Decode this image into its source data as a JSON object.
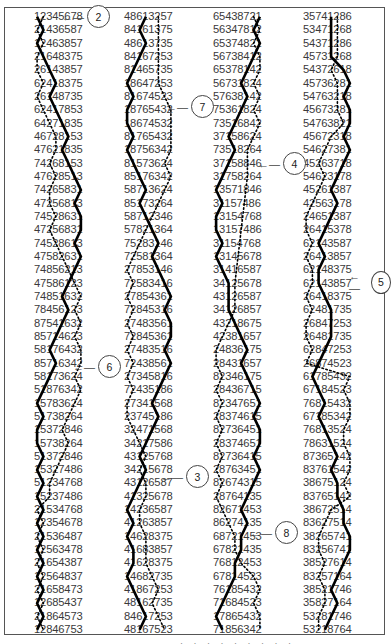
{
  "figure": {
    "columns": [
      {
        "x": 34,
        "rows": [
          "12345678",
          "21436587",
          "12463857",
          "21648375",
          "26143857",
          "62418375",
          "26148735",
          "62417853",
          "64271835",
          "46728153",
          "47621835",
          "74268153",
          "47628513",
          "74265831",
          "47256813",
          "74528631",
          "47256831",
          "74528613",
          "47582631",
          "74856213",
          "47586123",
          "74851632",
          "78456123",
          "87541632",
          "85714623",
          "58176432",
          "85716342",
          "58173624",
          "51876342",
          "15783624",
          "51738264",
          "15372846",
          "15738264",
          "51372846",
          "15327486",
          "51234768",
          "15237486",
          "21534768",
          "12354678",
          "21536487",
          "12563478",
          "21654387",
          "12564837",
          "21658473",
          "12685437",
          "21864573",
          "12846753"
        ]
      },
      {
        "x": 124,
        "rows": [
          "48613257",
          "84161375",
          "48613735",
          "84167253",
          "81465735",
          "18647253",
          "81674523",
          "18765432",
          "18674532",
          "81765432",
          "18756342",
          "81573624",
          "85176342",
          "58713624",
          "85173264",
          "58712346",
          "57821364",
          "75283146",
          "72581364",
          "27853146",
          "72583416",
          "27854361",
          "72845316",
          "27483561",
          "72845361",
          "27483516",
          "72438561",
          "27345816",
          "72435186",
          "27341568",
          "23745186",
          "32471568",
          "34217586",
          "43125768",
          "34215678",
          "43126587",
          "41325678",
          "14236587",
          "41263857",
          "14628375",
          "41683857",
          "41628375",
          "14682735",
          "41867253",
          "48162735",
          "84617253",
          "48167523"
        ]
      },
      {
        "x": 213,
        "rows": [
          "65438721",
          "56347812",
          "65374821",
          "56738412",
          "65378142",
          "56731824",
          "57638142",
          "75361824",
          "73516842",
          "37158624",
          "73518264",
          "37158846",
          "31758264",
          "13571846",
          "31157486",
          "13154768",
          "13157486",
          "31154768",
          "13145678",
          "31416587",
          "34125678",
          "43126587",
          "34126857",
          "43218675",
          "42381657",
          "24836175",
          "28431657",
          "82346175",
          "28436715",
          "82347651",
          "28374615",
          "82736451",
          "28374651",
          "82736415",
          "28763451",
          "82674315",
          "28764135",
          "82671453",
          "86274135",
          "68721453",
          "67821435",
          "76812453",
          "67814523",
          "76185432",
          "71684523",
          "17865432",
          "71856342"
        ]
      },
      {
        "x": 303,
        "rows": [
          "35741286",
          "53471268",
          "54371286",
          "45731268",
          "54372618",
          "45736281",
          "54763218",
          "45673281",
          "54763821",
          "45672318",
          "54627381",
          "45263718",
          "54623178",
          "45261387",
          "42563178",
          "24651387",
          "26415378",
          "62143587",
          "26413857",
          "62148375",
          "62143857",
          "26418375",
          "62481735",
          "26847253",
          "26481735",
          "62847253",
          "26874523",
          "61785432",
          "67184523",
          "76815432",
          "67185342",
          "76813524",
          "78631524",
          "87365142",
          "83761542",
          "38675124",
          "83765142",
          "38672514",
          "83627514",
          "38265741",
          "83256741",
          "38527614",
          "83257164",
          "38521746",
          "35827164",
          "53281746",
          "53218764"
        ]
      }
    ],
    "callouts": [
      {
        "label": "2",
        "x": 62,
        "y": 5
      },
      {
        "label": "7",
        "x": 166,
        "y": 95
      },
      {
        "label": "4",
        "x": 258,
        "y": 152
      },
      {
        "label": "5",
        "x": 349,
        "y": 270
      },
      {
        "label": "6",
        "x": 73,
        "y": 355
      },
      {
        "label": "3",
        "x": 161,
        "y": 465
      },
      {
        "label": "8",
        "x": 250,
        "y": 521
      }
    ],
    "solid_bell": "1",
    "dotted_bell": "2",
    "footer_fragment": "· · · · · · · · ·"
  },
  "colors": {
    "text": "#3a3a3a",
    "line": "#000000",
    "frame": "#555555"
  }
}
